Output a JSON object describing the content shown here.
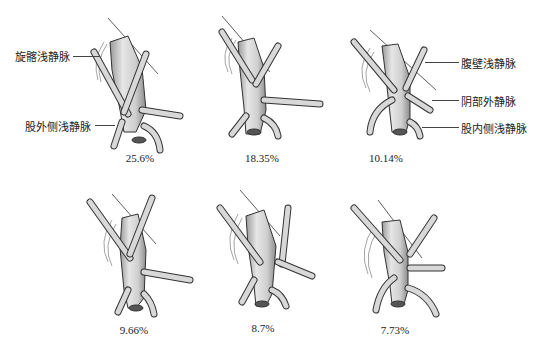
{
  "diagram": {
    "labels": {
      "superficial_circumflex_iliac_vein": "旋髂浅静脉",
      "lateral_superficial_femoral_vein": "股外侧浅静脉",
      "superficial_epigastric_vein": "腹壁浅静脉",
      "external_pudendal_vein": "阴部外静脉",
      "medial_superficial_femoral_vein": "股内侧浅静脉"
    },
    "panels": [
      {
        "id": "type-1",
        "percentage": "25.6%"
      },
      {
        "id": "type-2",
        "percentage": "18.35%"
      },
      {
        "id": "type-3",
        "percentage": "10.14%"
      },
      {
        "id": "type-4",
        "percentage": "9.66%"
      },
      {
        "id": "type-5",
        "percentage": "8.7%"
      },
      {
        "id": "type-6",
        "percentage": "7.73%"
      }
    ],
    "colors": {
      "vein_fill": "#d9d9d9",
      "vein_shade": "#8a8a8a",
      "outline": "#333333",
      "background": "#ffffff"
    }
  }
}
